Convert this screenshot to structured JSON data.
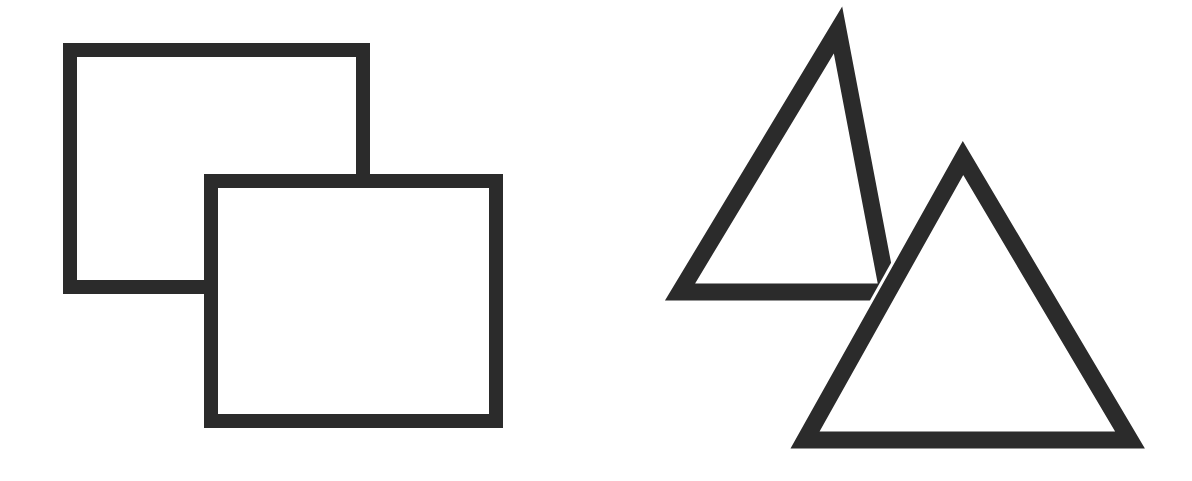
{
  "figure": {
    "background_color": "#ffffff",
    "stroke_color": "#2b2b2b",
    "canvas_width": 1192,
    "canvas_height": 481,
    "panels": [
      {
        "id": "squares-panel",
        "label": "Overlapping squares",
        "caption": ""
      },
      {
        "id": "triangles-panel",
        "label": "Overlapping triangles",
        "caption": ""
      }
    ]
  },
  "chart_data": {
    "type": "scatter",
    "xlabel": "",
    "ylabel": "",
    "xlim": [
      0,
      1192
    ],
    "ylim": [
      0,
      481
    ],
    "grid": false,
    "legend_position": "none",
    "shapes": [
      {
        "name": "square-back",
        "kind": "square",
        "panel": "squares-panel",
        "z_order": 1,
        "occluded_by": "square-front",
        "stroke_width": 14,
        "stroke_color": "#2b2b2b",
        "fill": "none",
        "x": 70,
        "y": 50,
        "width": 293,
        "height": 237,
        "vertices": [
          [
            70,
            50
          ],
          [
            363,
            50
          ],
          [
            363,
            287
          ],
          [
            70,
            287
          ]
        ]
      },
      {
        "name": "square-front",
        "kind": "square",
        "panel": "squares-panel",
        "z_order": 2,
        "occluded_by": null,
        "stroke_width": 14,
        "stroke_color": "#2b2b2b",
        "fill": "none",
        "x": 211,
        "y": 181,
        "width": 285,
        "height": 240,
        "vertices": [
          [
            211,
            181
          ],
          [
            496,
            181
          ],
          [
            496,
            421
          ],
          [
            211,
            421
          ]
        ]
      },
      {
        "name": "triangle-back",
        "kind": "triangle",
        "panel": "triangles-panel",
        "z_order": 1,
        "occluded_by": "triangle-front",
        "stroke_width": 17,
        "stroke_color": "#2b2b2b",
        "fill": "none",
        "vertices": [
          [
            838,
            30
          ],
          [
            680,
            292
          ],
          [
            888,
            292
          ]
        ],
        "apex": [
          838,
          30
        ],
        "base_left": [
          680,
          292
        ],
        "base_right": [
          888,
          292
        ]
      },
      {
        "name": "triangle-front",
        "kind": "triangle",
        "panel": "triangles-panel",
        "z_order": 2,
        "occluded_by": null,
        "stroke_width": 17,
        "stroke_color": "#2b2b2b",
        "fill": "none",
        "vertices": [
          [
            963,
            158
          ],
          [
            805,
            440
          ],
          [
            1130,
            440
          ]
        ],
        "apex": [
          963,
          158
        ],
        "base_left": [
          805,
          440
        ],
        "base_right": [
          1130,
          440
        ]
      }
    ]
  }
}
